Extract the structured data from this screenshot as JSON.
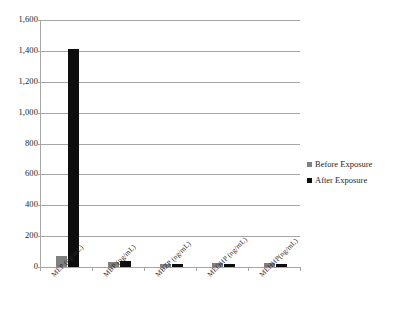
{
  "chart_data": {
    "type": "bar",
    "title": "",
    "xlabel": "",
    "ylabel": "",
    "ylim": [
      0,
      1600
    ],
    "ytick_step": 200,
    "grid": true,
    "legend_position": "right",
    "categories": [
      "MEP (ng/mL)",
      "MBP (ng/mL)",
      "MBZP (ng/mL)",
      "MEOHP (ng/mL)",
      "MEHHP(ng/mL)"
    ],
    "ytick_labels": [
      "0",
      "200",
      "400",
      "600",
      "800",
      "1,000",
      "1,200",
      "1,400",
      "1,600"
    ],
    "series": [
      {
        "name": "Before Exposure",
        "color": "#808080",
        "values": [
          70,
          35,
          18,
          25,
          28
        ]
      },
      {
        "name": "After Exposure",
        "color": "#0d0d0d",
        "values": [
          1410,
          38,
          20,
          22,
          20
        ]
      }
    ]
  },
  "legend": {
    "items": [
      {
        "label": "Before Exposure",
        "marker": "square-gray"
      },
      {
        "label": "After Exposure",
        "marker": "square-black"
      }
    ]
  }
}
